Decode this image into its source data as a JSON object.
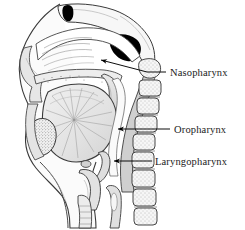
{
  "figure": {
    "background_color": "#ffffff",
    "ink_color": "#1a1a1a",
    "line_color": "#000000"
  },
  "labels": [
    {
      "id": "nasopharynx",
      "text": "Nasopharynx",
      "leader": {
        "style": "diagonal-arrow",
        "arrow_tip": [
          101,
          60
        ],
        "elbow": [
          147,
          72
        ],
        "text_anchor": [
          168,
          72
        ]
      }
    },
    {
      "id": "oropharynx",
      "text": "Oropharynx",
      "leader": {
        "style": "horizontal-arrow",
        "arrow_tip": [
          118,
          129
        ],
        "elbow": [
          118,
          129
        ],
        "text_anchor": [
          172,
          129
        ]
      }
    },
    {
      "id": "laryngopharynx",
      "text": "Laryngopharynx",
      "leader": {
        "style": "horizontal-arrow",
        "arrow_tip": [
          114,
          161
        ],
        "elbow": [
          114,
          161
        ],
        "text_anchor": [
          153,
          161
        ]
      }
    }
  ],
  "structures": {
    "frontal_sinus": {
      "name": "frontal-sinus",
      "fill": "#000000"
    },
    "sphenoid_sinus": {
      "name": "sphenoid-sinus",
      "fill": "#000000"
    },
    "nasal_cavity": {
      "name": "nasal-cavity",
      "fill": "#ffffff"
    },
    "tongue": {
      "name": "tongue",
      "fill": "#e8e8e8"
    },
    "soft_palate": {
      "name": "soft-palate",
      "fill": "#d8d8d8"
    },
    "mandible": {
      "name": "mandible-section",
      "fill": "#f2f2f2"
    },
    "vertebrae": {
      "name": "cervical-vertebrae",
      "count": 7,
      "fill": "#f4f4f4"
    },
    "pharyngeal_wall": {
      "name": "pharyngeal-wall",
      "fill": "#cfcfcf"
    },
    "epiglottis": {
      "name": "epiglottis",
      "fill": "#dcdcdc"
    },
    "trachea": {
      "name": "trachea",
      "fill": "#e4e4e4"
    },
    "hyoid": {
      "name": "hyoid-bone",
      "fill": "#d5d5d5"
    }
  }
}
